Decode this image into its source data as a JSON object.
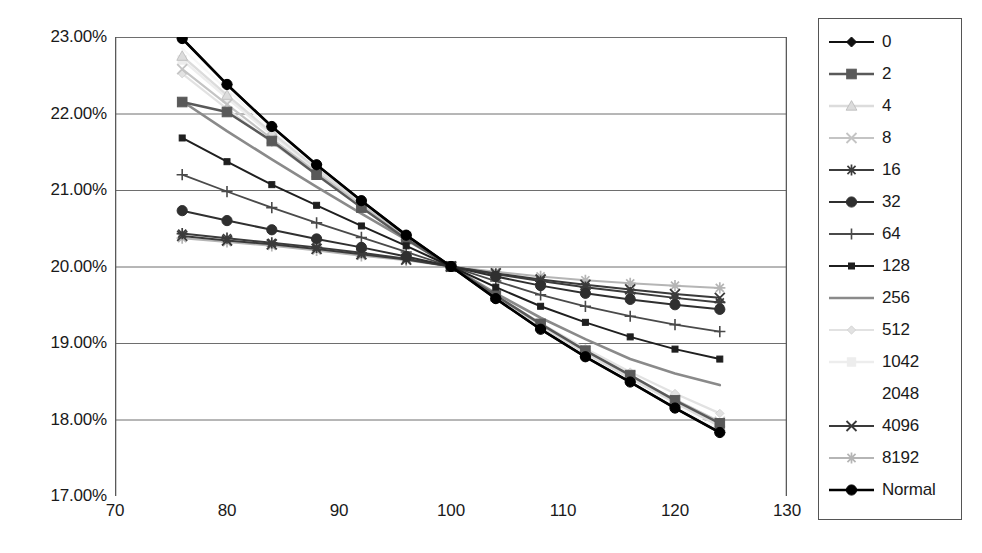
{
  "chart_data": {
    "type": "line",
    "title": "",
    "xlabel": "",
    "ylabel": "",
    "xlim": [
      70,
      130
    ],
    "ylim": [
      0.17,
      0.23
    ],
    "xticks": [
      70,
      80,
      90,
      100,
      110,
      120,
      130
    ],
    "xticklabels": [
      "70",
      "80",
      "90",
      "100",
      "110",
      "120",
      "130"
    ],
    "yticks": [
      0.17,
      0.18,
      0.19,
      0.2,
      0.21,
      0.22,
      0.23
    ],
    "yticklabels": [
      "17.00%",
      "18.00%",
      "19.00%",
      "20.00%",
      "21.00%",
      "22.00%",
      "23.00%"
    ],
    "grid": "horizontal",
    "legend_position": "right-outside",
    "x": [
      76,
      80,
      84,
      88,
      92,
      96,
      100,
      104,
      108,
      112,
      116,
      120,
      124
    ],
    "series": [
      {
        "name": "0",
        "marker": "diamond",
        "color": "#111111",
        "width": 2.2,
        "values": [
          0.2298,
          0.2238,
          0.2183,
          0.2133,
          0.2086,
          0.2041,
          0.2,
          0.1958,
          0.1918,
          0.1882,
          0.1849,
          0.1815,
          0.1783
        ]
      },
      {
        "name": "2",
        "marker": "square",
        "color": "#595959",
        "width": 2.4,
        "values": [
          0.2215,
          0.2202,
          0.2164,
          0.212,
          0.2077,
          0.2036,
          0.2,
          0.1962,
          0.1925,
          0.189,
          0.1858,
          0.1825,
          0.1795
        ]
      },
      {
        "name": "4",
        "marker": "triangle",
        "color": "#dcdcdc",
        "width": 2.4,
        "values": [
          0.2275,
          0.2224,
          0.2175,
          0.2128,
          0.2083,
          0.204,
          0.2,
          0.196,
          0.1922,
          0.1887,
          0.1854,
          0.1822,
          0.1791
        ]
      },
      {
        "name": "8",
        "marker": "cross",
        "color": "#c4c4c4",
        "width": 2.2,
        "values": [
          0.2258,
          0.2212,
          0.2167,
          0.2123,
          0.208,
          0.2039,
          0.2,
          0.1961,
          0.1924,
          0.189,
          0.1857,
          0.1826,
          0.1797
        ]
      },
      {
        "name": "16",
        "marker": "asterisk",
        "color": "#3c3c3c",
        "width": 2.0,
        "values": [
          0.2043,
          0.2037,
          0.2031,
          0.2025,
          0.2018,
          0.201,
          0.2,
          0.199,
          0.1981,
          0.1973,
          0.1966,
          0.1959,
          0.1953
        ]
      },
      {
        "name": "32",
        "marker": "circle",
        "color": "#2f2f2f",
        "width": 2.0,
        "values": [
          0.2073,
          0.206,
          0.2048,
          0.2036,
          0.2025,
          0.2013,
          0.2,
          0.1987,
          0.1975,
          0.1965,
          0.1957,
          0.195,
          0.1944
        ]
      },
      {
        "name": "64",
        "marker": "plus",
        "color": "#4a4a4a",
        "width": 1.8,
        "values": [
          0.212,
          0.2098,
          0.2077,
          0.2057,
          0.2038,
          0.2019,
          0.2,
          0.1981,
          0.1963,
          0.1948,
          0.1935,
          0.1924,
          0.1915
        ]
      },
      {
        "name": "128",
        "marker": "small-square",
        "color": "#1f1f1f",
        "width": 2.0,
        "values": [
          0.2168,
          0.2137,
          0.2107,
          0.208,
          0.2053,
          0.2027,
          0.2,
          0.1973,
          0.1948,
          0.1927,
          0.1908,
          0.1892,
          0.1879
        ]
      },
      {
        "name": "256",
        "marker": "line",
        "color": "#8a8a8a",
        "width": 2.6,
        "values": [
          0.2216,
          0.2177,
          0.214,
          0.2104,
          0.2069,
          0.2035,
          0.2,
          0.1965,
          0.1933,
          0.1905,
          0.1879,
          0.186,
          0.1845
        ]
      },
      {
        "name": "512",
        "marker": "faint-diamond",
        "color": "#e2e2e2",
        "width": 2.2,
        "values": [
          0.2252,
          0.2206,
          0.2162,
          0.212,
          0.2078,
          0.2038,
          0.2,
          0.1962,
          0.1926,
          0.1893,
          0.1862,
          0.1834,
          0.1808
        ]
      },
      {
        "name": "1042",
        "marker": "faint-square",
        "color": "#ededed",
        "width": 2.4,
        "values": [
          0.227,
          0.222,
          0.2172,
          0.2126,
          0.2082,
          0.204,
          0.2,
          0.196,
          0.1922,
          0.1887,
          0.1854,
          0.1823,
          0.1794
        ]
      },
      {
        "name": "2048",
        "marker": "none",
        "color": "#f7f7f7",
        "width": 2.2,
        "values": [
          0.2285,
          0.2231,
          0.2179,
          0.2131,
          0.2085,
          0.2041,
          0.2,
          0.1959,
          0.192,
          0.1884,
          0.185,
          0.1817,
          0.1787
        ]
      },
      {
        "name": "4096",
        "marker": "x",
        "color": "#3a3a3a",
        "width": 2.0,
        "values": [
          0.204,
          0.2034,
          0.2029,
          0.2023,
          0.2016,
          0.2009,
          0.2,
          0.1991,
          0.1983,
          0.1976,
          0.197,
          0.1964,
          0.1959
        ]
      },
      {
        "name": "8192",
        "marker": "light-asterisk",
        "color": "#b5b5b5",
        "width": 2.0,
        "values": [
          0.2037,
          0.2032,
          0.2027,
          0.2021,
          0.2014,
          0.2008,
          0.2,
          0.1993,
          0.1987,
          0.1982,
          0.1978,
          0.1975,
          0.1972
        ]
      },
      {
        "name": "Normal",
        "marker": "filled-circle",
        "color": "#000000",
        "width": 2.6,
        "values": [
          0.2298,
          0.2238,
          0.2183,
          0.2133,
          0.2086,
          0.2041,
          0.2,
          0.1958,
          0.1918,
          0.1882,
          0.1849,
          0.1815,
          0.1783
        ]
      }
    ]
  }
}
